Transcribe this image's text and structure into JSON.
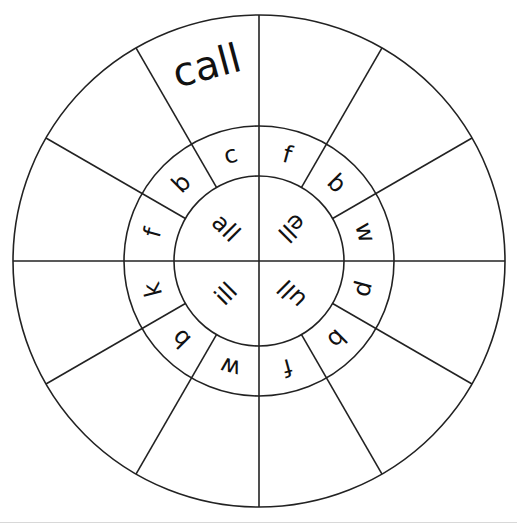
{
  "worksheet": {
    "type": "word-family-wheel",
    "center": {
      "x": 259,
      "y": 261
    },
    "radii": {
      "inner": 85,
      "middle": 135,
      "outer": 246
    },
    "colors": {
      "line": "#222222",
      "text": "#111111",
      "background": "#ffffff"
    },
    "rimes": [
      {
        "id": "all",
        "label": "all",
        "angle": 315,
        "rotation": 45
      },
      {
        "id": "ell",
        "label": "ell",
        "angle": 45,
        "rotation": 135
      },
      {
        "id": "ull",
        "label": "ull",
        "angle": 135,
        "rotation": 225
      },
      {
        "id": "ill",
        "label": "ill",
        "angle": 225,
        "rotation": 315
      }
    ],
    "onsets": [
      {
        "letter": "f",
        "angle": 15,
        "rime": "ell"
      },
      {
        "letter": "b",
        "angle": 45,
        "rime": "ell"
      },
      {
        "letter": "w",
        "angle": 75,
        "rime": "ell"
      },
      {
        "letter": "p",
        "angle": 105,
        "rime": "ull"
      },
      {
        "letter": "b",
        "angle": 135,
        "rime": "ull"
      },
      {
        "letter": "f",
        "angle": 165,
        "rime": "ull"
      },
      {
        "letter": "w",
        "angle": 195,
        "rime": "ill"
      },
      {
        "letter": "b",
        "angle": 225,
        "rime": "ill"
      },
      {
        "letter": "k",
        "angle": 255,
        "rime": "ill"
      },
      {
        "letter": "f",
        "angle": 285,
        "rime": "all"
      },
      {
        "letter": "b",
        "angle": 315,
        "rime": "all"
      },
      {
        "letter": "c",
        "angle": 345,
        "rime": "all"
      }
    ],
    "answers": [
      {
        "angle": 15,
        "value": ""
      },
      {
        "angle": 45,
        "value": ""
      },
      {
        "angle": 75,
        "value": ""
      },
      {
        "angle": 105,
        "value": ""
      },
      {
        "angle": 135,
        "value": ""
      },
      {
        "angle": 165,
        "value": ""
      },
      {
        "angle": 195,
        "value": ""
      },
      {
        "angle": 225,
        "value": ""
      },
      {
        "angle": 255,
        "value": ""
      },
      {
        "angle": 285,
        "value": ""
      },
      {
        "angle": 315,
        "value": ""
      },
      {
        "angle": 345,
        "value": "call"
      }
    ],
    "spoke_angles": [
      0,
      30,
      60,
      90,
      120,
      150,
      180,
      210,
      240,
      270,
      300,
      330
    ]
  }
}
